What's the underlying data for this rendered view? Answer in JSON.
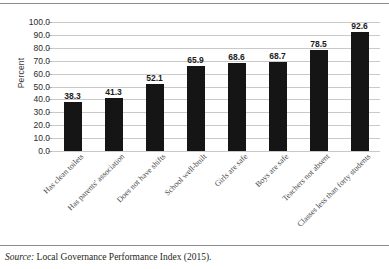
{
  "figure": {
    "source_label": "Source:",
    "source_text": "Local Governance Performance Index (2015)."
  },
  "chart_data": {
    "type": "bar",
    "title": "",
    "xlabel": "",
    "ylabel": "Percent",
    "ylim": [
      0,
      100
    ],
    "ytick_step": 10,
    "grid": true,
    "legend": "none",
    "orientation": "vertical",
    "bar_color": "#151515",
    "gridline_color": "#c9c9c9",
    "value_label_format": "one-decimal",
    "categories": [
      "Has clean toilets",
      "Has parents' association",
      "Does not have shifts",
      "School well-built",
      "Girls are safe",
      "Boys are safe",
      "Teachers not absent",
      "Classes less than forty students"
    ],
    "values": [
      38.3,
      41.3,
      52.1,
      65.9,
      68.6,
      68.7,
      78.5,
      92.6
    ],
    "ytick_labels": [
      "100.0",
      "90.0",
      "80.0",
      "70.0",
      "60.0",
      "50.0",
      "40.0",
      "30.0",
      "20.0",
      "10.0",
      "0.0"
    ]
  }
}
